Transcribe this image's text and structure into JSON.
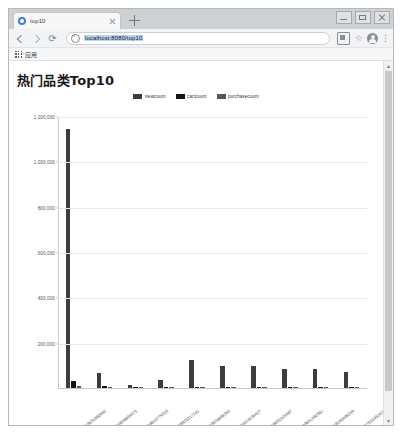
{
  "browser": {
    "tab": {
      "title": "top10",
      "favicon": "globe-icon",
      "close": "close-icon"
    },
    "new_tab_label": "+",
    "window_controls": {
      "minimize": "minimize-icon",
      "maximize": "maximize-icon",
      "close": "window-close-icon"
    },
    "toolbar": {
      "back": "back-arrow-icon",
      "forward": "forward-arrow-icon",
      "reload": "⟳",
      "site_info": "info-icon",
      "url": "localhost:8080/top10",
      "url_placeholder": "Search Google or type a URL",
      "extensions": "extensions-icon",
      "bookmark_star": "☆",
      "profile": "avatar-icon",
      "menu": "⋮"
    },
    "bookmarks": {
      "apps_label": "应用",
      "apps_icon": "apps-grid-icon"
    }
  },
  "page": {
    "title": "热门品类Top10"
  },
  "scrollbar": {
    "up": "▲",
    "down": "▼"
  },
  "chart_data": {
    "type": "bar",
    "title": "热门品类Top10",
    "xlabel": "",
    "ylabel": "",
    "ylim": [
      0,
      1200000
    ],
    "grid": true,
    "legend_position": "top",
    "yticks": [
      200000,
      400000,
      600000,
      800000,
      1000000,
      1200000
    ],
    "ytick_labels": [
      "200,000",
      "400,000",
      "600,000",
      "800,000",
      "1,000,000",
      "1,200,000"
    ],
    "categories": [
      "2053013555631882655",
      "2053013554658804075",
      "2053013563810775923",
      "2053013558920217191",
      "2053013553559896355",
      "2053013554415534427",
      "2053013558031024687",
      "2053013563651392361",
      "2053013558190408249",
      "2053013557024391671"
    ],
    "series": [
      {
        "name": "viewcount",
        "color": "#3d3d3d",
        "values": [
          1148000,
          68000,
          14000,
          34000,
          125000,
          98000,
          96000,
          86000,
          84000,
          71000
        ]
      },
      {
        "name": "cartcount",
        "color": "#141414",
        "values": [
          29000,
          8500,
          2200,
          4200,
          6200,
          4000,
          3900,
          3600,
          3200,
          2600
        ]
      },
      {
        "name": "purchasecount",
        "color": "#565656",
        "values": [
          9000,
          2600,
          700,
          1300,
          2000,
          1200,
          1200,
          1100,
          1000,
          800
        ]
      }
    ]
  }
}
